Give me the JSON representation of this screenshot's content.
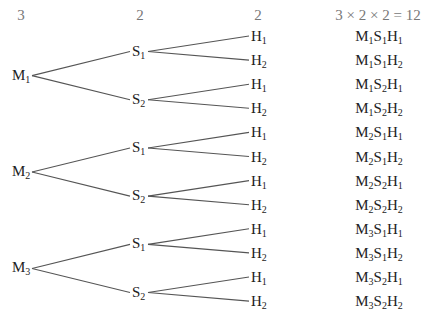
{
  "headers": {
    "mains_count": "3",
    "sides_count": "2",
    "drinks_count": "2",
    "total_equation": "3 × 2 × 2 = 12"
  },
  "tree": [
    {
      "label": "M",
      "sub": "1",
      "children": [
        {
          "label": "S",
          "sub": "1",
          "children": [
            {
              "label": "H",
              "sub": "1"
            },
            {
              "label": "H",
              "sub": "2"
            }
          ]
        },
        {
          "label": "S",
          "sub": "2",
          "children": [
            {
              "label": "H",
              "sub": "1"
            },
            {
              "label": "H",
              "sub": "2"
            }
          ]
        }
      ]
    },
    {
      "label": "M",
      "sub": "2",
      "children": [
        {
          "label": "S",
          "sub": "1",
          "children": [
            {
              "label": "H",
              "sub": "1"
            },
            {
              "label": "H",
              "sub": "2"
            }
          ]
        },
        {
          "label": "S",
          "sub": "2",
          "children": [
            {
              "label": "H",
              "sub": "1"
            },
            {
              "label": "H",
              "sub": "2"
            }
          ]
        }
      ]
    },
    {
      "label": "M",
      "sub": "3",
      "children": [
        {
          "label": "S",
          "sub": "1",
          "children": [
            {
              "label": "H",
              "sub": "1"
            },
            {
              "label": "H",
              "sub": "2"
            }
          ]
        },
        {
          "label": "S",
          "sub": "2",
          "children": [
            {
              "label": "H",
              "sub": "1"
            },
            {
              "label": "H",
              "sub": "2"
            }
          ]
        }
      ]
    }
  ],
  "outcomes": [
    [
      [
        "M",
        "1"
      ],
      [
        "S",
        "1"
      ],
      [
        "H",
        "1"
      ]
    ],
    [
      [
        "M",
        "1"
      ],
      [
        "S",
        "1"
      ],
      [
        "H",
        "2"
      ]
    ],
    [
      [
        "M",
        "1"
      ],
      [
        "S",
        "2"
      ],
      [
        "H",
        "1"
      ]
    ],
    [
      [
        "M",
        "1"
      ],
      [
        "S",
        "2"
      ],
      [
        "H",
        "2"
      ]
    ],
    [
      [
        "M",
        "2"
      ],
      [
        "S",
        "1"
      ],
      [
        "H",
        "1"
      ]
    ],
    [
      [
        "M",
        "2"
      ],
      [
        "S",
        "1"
      ],
      [
        "H",
        "2"
      ]
    ],
    [
      [
        "M",
        "2"
      ],
      [
        "S",
        "2"
      ],
      [
        "H",
        "1"
      ]
    ],
    [
      [
        "M",
        "2"
      ],
      [
        "S",
        "2"
      ],
      [
        "H",
        "2"
      ]
    ],
    [
      [
        "M",
        "3"
      ],
      [
        "S",
        "1"
      ],
      [
        "H",
        "1"
      ]
    ],
    [
      [
        "M",
        "3"
      ],
      [
        "S",
        "1"
      ],
      [
        "H",
        "2"
      ]
    ],
    [
      [
        "M",
        "3"
      ],
      [
        "S",
        "2"
      ],
      [
        "H",
        "1"
      ]
    ],
    [
      [
        "M",
        "3"
      ],
      [
        "S",
        "2"
      ],
      [
        "H",
        "2"
      ]
    ]
  ],
  "colors": {
    "text": "#222222",
    "header_text": "#777777",
    "line": "#555555"
  }
}
